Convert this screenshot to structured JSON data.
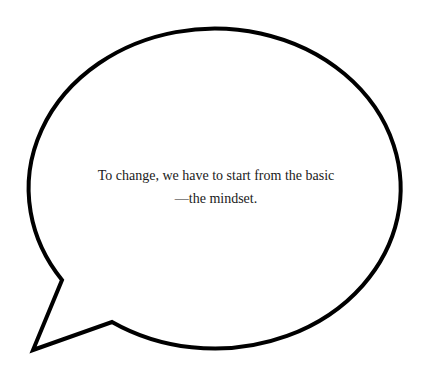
{
  "bubble": {
    "text": "To change, we have to start from the basic—the mindset.",
    "stroke_color": "#000000",
    "fill_color": "#ffffff"
  }
}
